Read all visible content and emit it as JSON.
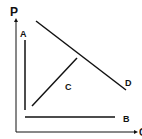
{
  "diagram": {
    "axes": {
      "y_label": "P",
      "x_label": "Q"
    },
    "lines": [
      {
        "label": "A",
        "orientation": "vertical"
      },
      {
        "label": "B",
        "orientation": "horizontal"
      },
      {
        "label": "C",
        "orientation": "upward-sloping"
      },
      {
        "label": "D",
        "orientation": "downward-sloping"
      }
    ],
    "colors": {
      "line": "#111111",
      "background": "#ffffff"
    }
  }
}
